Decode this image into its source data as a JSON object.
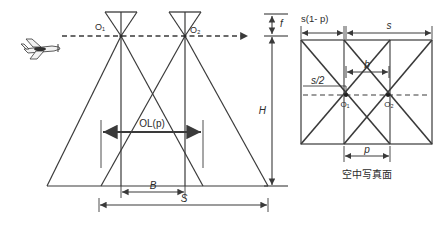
{
  "figure": {
    "background_color": "#ffffff",
    "line_color": "#3a3a3a",
    "text_color": "#2b2b2b"
  },
  "left_panel": {
    "name": "flight-cross-section",
    "stations": [
      {
        "id": "O1",
        "label": "O₁",
        "x": 121,
        "y": 36
      },
      {
        "id": "O2",
        "label": "O₂",
        "x": 185,
        "y": 36
      }
    ],
    "flight_line": {
      "label": "flight-path",
      "style": "dashed",
      "y": 36,
      "arrow": "right"
    },
    "aircraft": {
      "label": "airplane-icon",
      "x": 42,
      "y": 47
    },
    "dimensions": [
      {
        "id": "f",
        "label": "f",
        "orientation": "vertical",
        "from_y": 14,
        "to_y": 36
      },
      {
        "id": "H",
        "label": "H",
        "orientation": "vertical",
        "from_y": 36,
        "to_y": 186
      },
      {
        "id": "OLp",
        "label": "OL(p)",
        "orientation": "horizontal",
        "from_x": 101,
        "to_x": 203,
        "y": 132
      },
      {
        "id": "B",
        "label": "B",
        "orientation": "horizontal",
        "from_x": 121,
        "to_x": 185,
        "y": 192
      },
      {
        "id": "S",
        "label": "S",
        "orientation": "horizontal",
        "from_x": 99,
        "to_x": 268,
        "y": 205
      }
    ]
  },
  "right_panel": {
    "name": "aerial-photo-plane",
    "caption": "空中写真面",
    "stations": [
      {
        "id": "O1",
        "label": "O₁",
        "x": 346,
        "y": 95
      },
      {
        "id": "O2",
        "label": "O₂",
        "x": 388,
        "y": 95
      }
    ],
    "center_line": {
      "label": "photo-center-line",
      "style": "dashed",
      "y": 95
    },
    "dimensions": [
      {
        "id": "s1mp",
        "label": "s(1- p)",
        "orientation": "horizontal",
        "from_x": 301,
        "to_x": 344,
        "y": 33
      },
      {
        "id": "s",
        "label": "s",
        "orientation": "horizontal",
        "from_x": 346,
        "to_x": 432,
        "y": 33
      },
      {
        "id": "b",
        "label": "b",
        "orientation": "horizontal",
        "from_x": 346,
        "to_x": 389,
        "y": 72
      },
      {
        "id": "s_2",
        "label": "s/2",
        "orientation": "horizontal",
        "from_x": 303,
        "to_x": 346,
        "y": 86
      },
      {
        "id": "p",
        "label": "p",
        "orientation": "horizontal",
        "from_x": 344,
        "to_x": 390,
        "y": 156
      }
    ],
    "frame": {
      "left": 301,
      "right": 432,
      "top": 40,
      "bottom": 144
    }
  }
}
